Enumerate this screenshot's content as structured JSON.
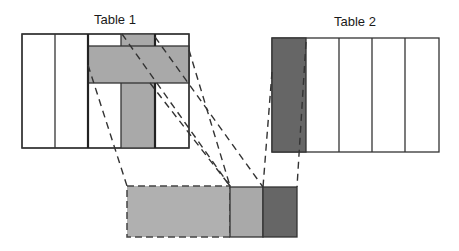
{
  "table1": {
    "title": "Table 1",
    "columns": 5,
    "highlighted_row_color": "#a9a9a9",
    "highlighted_column_color": "#a9a9a9"
  },
  "table2": {
    "title": "Table 2",
    "columns": 5,
    "highlighted_column_color": "#666666"
  },
  "result": {
    "segments": [
      {
        "name": "table1-row",
        "style": "dashed",
        "color": "#b0b0b0"
      },
      {
        "name": "table1-column",
        "style": "solid",
        "color": "#a9a9a9"
      },
      {
        "name": "table2-column",
        "style": "solid",
        "color": "#666666"
      }
    ]
  },
  "colors": {
    "border": "#333333",
    "white": "#ffffff"
  }
}
